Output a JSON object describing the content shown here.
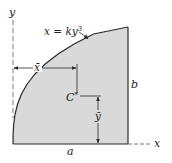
{
  "diagram": {
    "type": "centroid-of-area",
    "colors": {
      "fill": "#d9d9d9",
      "stroke": "#2a2a2a",
      "axis": "#555555"
    },
    "labels": {
      "y_axis": "y",
      "x_axis": "x",
      "curve_equation_lhs": "x = ky",
      "curve_equation_exp": "3",
      "x_bar": "x̄",
      "y_bar": "ȳ",
      "centroid": "C",
      "centroid_marker": "*",
      "width": "a",
      "height": "b"
    }
  }
}
